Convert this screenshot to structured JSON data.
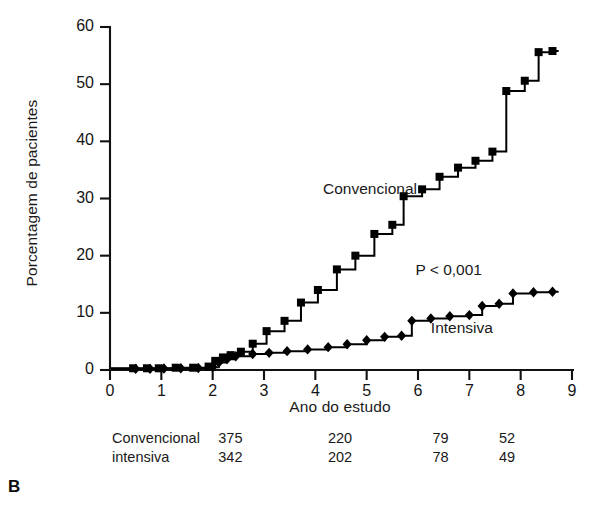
{
  "panel": {
    "letter": "B"
  },
  "chart_data": {
    "type": "line",
    "subtype": "step-kaplan-meier",
    "title": "",
    "xlabel": "Ano do estudo",
    "ylabel": "Porcentagem de pacientes",
    "xlim": [
      0,
      9
    ],
    "ylim": [
      0,
      60
    ],
    "xticks": [
      "0",
      "1",
      "2",
      "3",
      "4",
      "5",
      "6",
      "7",
      "8",
      "9"
    ],
    "yticks": [
      "0",
      "10",
      "20",
      "30",
      "40",
      "50",
      "60"
    ],
    "grid": false,
    "legend_position": "inline-annotations",
    "annotations": [
      {
        "text": "Convencional",
        "x": 4.15,
        "y": 31.5
      },
      {
        "text": "P < 0,001",
        "x": 5.95,
        "y": 17.3
      },
      {
        "text": "Intensiva",
        "x": 6.25,
        "y": 7.2
      }
    ],
    "series": [
      {
        "name": "Convencional",
        "marker": "square",
        "color": "#000000",
        "points": [
          {
            "x": 0.45,
            "y": 0.3
          },
          {
            "x": 0.72,
            "y": 0.3
          },
          {
            "x": 0.95,
            "y": 0.3
          },
          {
            "x": 1.28,
            "y": 0.4
          },
          {
            "x": 1.62,
            "y": 0.4
          },
          {
            "x": 1.92,
            "y": 0.6
          },
          {
            "x": 2.05,
            "y": 1.6
          },
          {
            "x": 2.2,
            "y": 2.2
          },
          {
            "x": 2.35,
            "y": 2.6
          },
          {
            "x": 2.55,
            "y": 3.2
          },
          {
            "x": 2.78,
            "y": 4.6
          },
          {
            "x": 3.05,
            "y": 6.8
          },
          {
            "x": 3.4,
            "y": 8.6
          },
          {
            "x": 3.72,
            "y": 11.8
          },
          {
            "x": 4.05,
            "y": 14.0
          },
          {
            "x": 4.42,
            "y": 17.6
          },
          {
            "x": 4.78,
            "y": 20.0
          },
          {
            "x": 5.15,
            "y": 23.8
          },
          {
            "x": 5.5,
            "y": 25.4
          },
          {
            "x": 5.72,
            "y": 30.4
          },
          {
            "x": 6.08,
            "y": 31.6
          },
          {
            "x": 6.42,
            "y": 33.8
          },
          {
            "x": 6.78,
            "y": 35.4
          },
          {
            "x": 7.12,
            "y": 36.6
          },
          {
            "x": 7.45,
            "y": 38.2
          },
          {
            "x": 7.72,
            "y": 48.8
          },
          {
            "x": 8.08,
            "y": 50.6
          },
          {
            "x": 8.35,
            "y": 55.6
          },
          {
            "x": 8.62,
            "y": 55.8
          }
        ]
      },
      {
        "name": "Intensiva",
        "marker": "diamond",
        "color": "#000000",
        "points": [
          {
            "x": 0.5,
            "y": 0.2
          },
          {
            "x": 0.78,
            "y": 0.2
          },
          {
            "x": 1.05,
            "y": 0.25
          },
          {
            "x": 1.38,
            "y": 0.3
          },
          {
            "x": 1.72,
            "y": 0.35
          },
          {
            "x": 2.0,
            "y": 0.5
          },
          {
            "x": 2.12,
            "y": 1.3
          },
          {
            "x": 2.28,
            "y": 1.9
          },
          {
            "x": 2.45,
            "y": 2.4
          },
          {
            "x": 2.78,
            "y": 2.8
          },
          {
            "x": 3.1,
            "y": 3.0
          },
          {
            "x": 3.45,
            "y": 3.3
          },
          {
            "x": 3.85,
            "y": 3.6
          },
          {
            "x": 4.25,
            "y": 4.0
          },
          {
            "x": 4.62,
            "y": 4.5
          },
          {
            "x": 5.0,
            "y": 5.2
          },
          {
            "x": 5.35,
            "y": 5.8
          },
          {
            "x": 5.68,
            "y": 6.0
          },
          {
            "x": 5.88,
            "y": 8.6
          },
          {
            "x": 6.25,
            "y": 9.0
          },
          {
            "x": 6.62,
            "y": 9.4
          },
          {
            "x": 7.0,
            "y": 9.6
          },
          {
            "x": 7.25,
            "y": 11.2
          },
          {
            "x": 7.58,
            "y": 11.6
          },
          {
            "x": 7.85,
            "y": 13.4
          },
          {
            "x": 8.25,
            "y": 13.6
          },
          {
            "x": 8.62,
            "y": 13.7
          }
        ]
      }
    ],
    "risk_table": {
      "rows": [
        {
          "label": "Convencional",
          "values": [
            "375",
            "220",
            "79",
            "52"
          ]
        },
        {
          "label": "intensiva",
          "values": [
            "342",
            "202",
            "78",
            "49"
          ]
        }
      ]
    }
  }
}
